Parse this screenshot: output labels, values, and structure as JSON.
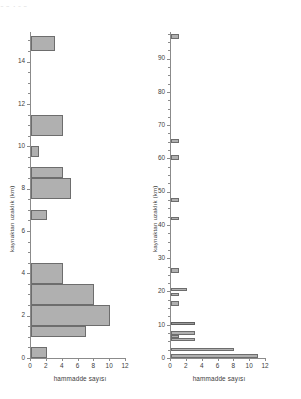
{
  "figure": {
    "top_remnant": "0    2    4   6      8",
    "background": "#ffffff",
    "bar_fill": "#b0b0b0",
    "bar_stroke": "#6d6d6d",
    "axis_color": "#8b8b8b"
  },
  "chart_data": [
    {
      "id": "left",
      "type": "bar",
      "orientation": "horizontal",
      "title": "",
      "xlabel": "hammadde sayısı",
      "ylabel": "kaynaktan uzaklık (km)",
      "xlim": [
        0,
        12
      ],
      "ylim": [
        0,
        15.4
      ],
      "xticks": [
        0,
        2,
        4,
        6,
        8,
        10,
        12
      ],
      "xticklabels": [
        "0",
        "2",
        "4",
        "6",
        "8",
        "10",
        "12"
      ],
      "yticks": [
        0,
        2,
        4,
        6,
        8,
        10,
        12,
        14
      ],
      "yticklabels": [
        "0",
        "2",
        "4",
        "6",
        "8",
        "10",
        "12",
        "14"
      ],
      "yminor_step": 0.5,
      "grid": false,
      "legend": null,
      "bins": [
        {
          "y_low": 0.0,
          "y_high": 0.5,
          "value": 2
        },
        {
          "y_low": 1.0,
          "y_high": 1.5,
          "value": 7
        },
        {
          "y_low": 1.5,
          "y_high": 2.5,
          "value": 10
        },
        {
          "y_low": 2.5,
          "y_high": 3.5,
          "value": 8
        },
        {
          "y_low": 3.5,
          "y_high": 4.5,
          "value": 4
        },
        {
          "y_low": 6.5,
          "y_high": 7.0,
          "value": 2
        },
        {
          "y_low": 7.5,
          "y_high": 8.5,
          "value": 5
        },
        {
          "y_low": 8.5,
          "y_high": 9.0,
          "value": 4
        },
        {
          "y_low": 9.5,
          "y_high": 10.0,
          "value": 1
        },
        {
          "y_low": 10.5,
          "y_high": 11.5,
          "value": 4
        },
        {
          "y_low": 14.5,
          "y_high": 15.2,
          "value": 3
        }
      ]
    },
    {
      "id": "right",
      "type": "bar",
      "orientation": "horizontal",
      "title": "",
      "xlabel": "hammadde sayısı",
      "ylabel": "kaynaktan uzaklık (km)",
      "xlim": [
        0,
        12
      ],
      "ylim": [
        0,
        98
      ],
      "xticks": [
        0,
        2,
        4,
        6,
        8,
        10,
        12
      ],
      "xticklabels": [
        "0",
        "2",
        "4",
        "6",
        "8",
        "10",
        "12"
      ],
      "yticks": [
        0,
        10,
        20,
        30,
        40,
        50,
        60,
        70,
        80,
        90
      ],
      "yticklabels": [
        "0",
        "10",
        "20",
        "30",
        "40",
        "50",
        "60",
        "70",
        "80",
        "90"
      ],
      "yminor_step": 2.5,
      "grid": false,
      "legend": null,
      "bins": [
        {
          "y_low": 0.0,
          "y_high": 1.2,
          "value": 11
        },
        {
          "y_low": 2.0,
          "y_high": 3.0,
          "value": 8
        },
        {
          "y_low": 5.0,
          "y_high": 6.0,
          "value": 3
        },
        {
          "y_low": 6.0,
          "y_high": 7.0,
          "value": 1
        },
        {
          "y_low": 7.0,
          "y_high": 8.0,
          "value": 3
        },
        {
          "y_low": 10.0,
          "y_high": 10.8,
          "value": 3
        },
        {
          "y_low": 15.5,
          "y_high": 17.0,
          "value": 1
        },
        {
          "y_low": 18.5,
          "y_high": 19.5,
          "value": 1
        },
        {
          "y_low": 20.0,
          "y_high": 21.0,
          "value": 2
        },
        {
          "y_low": 25.5,
          "y_high": 27.0,
          "value": 1
        },
        {
          "y_low": 41.5,
          "y_high": 42.5,
          "value": 1
        },
        {
          "y_low": 47.0,
          "y_high": 48.2,
          "value": 1
        },
        {
          "y_low": 59.5,
          "y_high": 61.0,
          "value": 1
        },
        {
          "y_low": 64.5,
          "y_high": 65.8,
          "value": 1
        },
        {
          "y_low": 96.0,
          "y_high": 97.3,
          "value": 1
        }
      ]
    }
  ]
}
